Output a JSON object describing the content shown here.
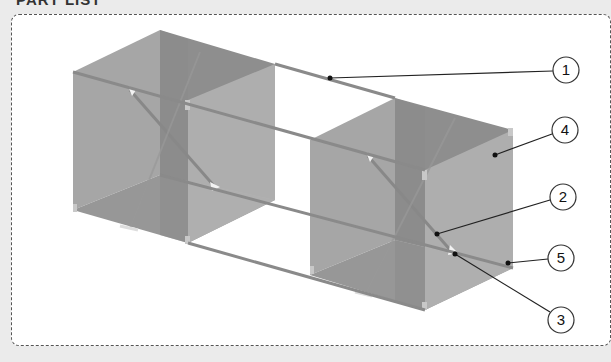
{
  "header": {
    "title": "PART LIST"
  },
  "diagram": {
    "colors": {
      "panel": "#a9a9a9",
      "panel_dark": "#8f8f8f",
      "panel_floor": "#9a9a9a",
      "rod": "#8a8a8a",
      "callout_line": "#222222",
      "frame_border": "#555555",
      "background": "#ebebeb"
    }
  },
  "callouts": [
    {
      "id": "1",
      "label": "1",
      "target": "connecting-rod-top"
    },
    {
      "id": "4",
      "label": "4",
      "target": "side-panel"
    },
    {
      "id": "2",
      "label": "2",
      "target": "diagonal-brace"
    },
    {
      "id": "5",
      "label": "5",
      "target": "corner-post"
    },
    {
      "id": "3",
      "label": "3",
      "target": "brace-clip"
    }
  ]
}
